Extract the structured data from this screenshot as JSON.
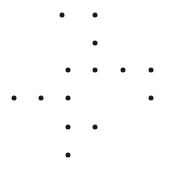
{
  "canvas": {
    "width": 179,
    "height": 177,
    "background_color": "#ffffff",
    "title": "Dot Pattern"
  },
  "marker": {
    "shape": "circle",
    "color": "#1a1a1a",
    "diameter": 5
  },
  "chart_data": {
    "type": "scatter",
    "title": "",
    "xlabel": "",
    "ylabel": "",
    "grid": false,
    "legend": null,
    "axes_visible": false,
    "xlim": [
      0,
      179
    ],
    "ylim": [
      0,
      177
    ],
    "point_count": 14,
    "columns": [
      14,
      41,
      62,
      68,
      95,
      123,
      151
    ],
    "rows": [
      15,
      43,
      70,
      98,
      127,
      155
    ],
    "points": [
      {
        "x": 62,
        "y": 15
      },
      {
        "x": 95,
        "y": 15
      },
      {
        "x": 95,
        "y": 43
      },
      {
        "x": 68,
        "y": 70
      },
      {
        "x": 95,
        "y": 70
      },
      {
        "x": 123,
        "y": 70
      },
      {
        "x": 151,
        "y": 70
      },
      {
        "x": 14,
        "y": 98
      },
      {
        "x": 41,
        "y": 98
      },
      {
        "x": 68,
        "y": 98
      },
      {
        "x": 151,
        "y": 98
      },
      {
        "x": 68,
        "y": 127
      },
      {
        "x": 95,
        "y": 127
      },
      {
        "x": 68,
        "y": 155
      }
    ]
  }
}
